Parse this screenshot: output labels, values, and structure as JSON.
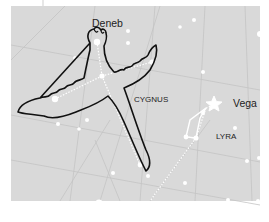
{
  "diagram": {
    "type": "star-chart",
    "background_color": "#d9d9d9",
    "margin_color": "#ffffff",
    "star_color": "#ffffff",
    "outline_color": "#111111",
    "labels": {
      "deneb": "Deneb",
      "cygnus": "CYGNUS",
      "vega": "Vega",
      "lyra": "LYRA"
    },
    "constellations": [
      {
        "name": "CYGNUS",
        "figure": "swan",
        "bright_star": "Deneb"
      },
      {
        "name": "LYRA",
        "figure": "lyre",
        "bright_star": "Vega"
      }
    ]
  }
}
